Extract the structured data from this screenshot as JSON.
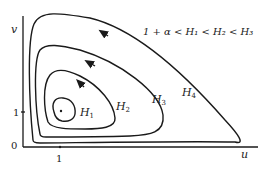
{
  "diagram": {
    "type": "phase-portrait",
    "condition": "1 + α < H₁ < H₂ < H₃",
    "axes": {
      "x_label": "u",
      "y_label": "v",
      "origin_label": "0",
      "x_tick_label": "1",
      "y_tick_label": "1"
    },
    "orbits": [
      {
        "name": "H1",
        "label_base": "H",
        "label_sub": "1",
        "has_arrow": false
      },
      {
        "name": "H2",
        "label_base": "H",
        "label_sub": "2",
        "has_arrow": true
      },
      {
        "name": "H3",
        "label_base": "H",
        "label_sub": "3",
        "has_arrow": true
      },
      {
        "name": "H4",
        "label_base": "H",
        "label_sub": "4",
        "has_arrow": true
      }
    ],
    "equilibrium": "(1, 1)"
  }
}
